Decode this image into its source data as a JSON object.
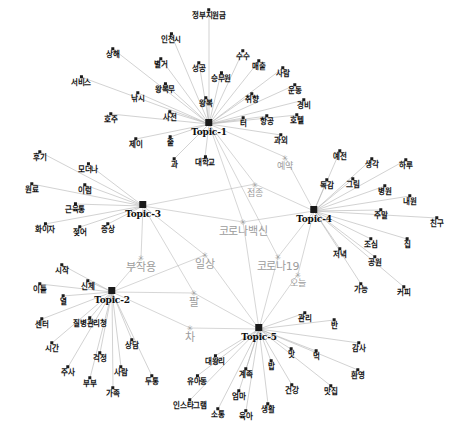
{
  "figure": {
    "type": "network-graph",
    "title": "",
    "background": "#ffffff",
    "node_color": "#111111",
    "shared_node_color": "#9c9c9c",
    "edge_color": "#b4b4b4",
    "width": 461,
    "height": 432
  },
  "chart_data": {
    "type": "network",
    "title": "",
    "topics": [
      {
        "id": "Topic-1",
        "label": "Topic-1",
        "x": 209,
        "y": 128
      },
      {
        "id": "Topic-2",
        "label": "Topic-2",
        "x": 112,
        "y": 296
      },
      {
        "id": "Topic-3",
        "label": "Topic-3",
        "x": 143,
        "y": 210
      },
      {
        "id": "Topic-4",
        "label": "Topic-4",
        "x": 314,
        "y": 215
      },
      {
        "id": "Topic-5",
        "label": "Topic-5",
        "x": 259,
        "y": 333
      }
    ],
    "keywords": [
      {
        "label": "정부지원금",
        "x": 209,
        "y": 14,
        "topic": "Topic-1"
      },
      {
        "label": "인천시",
        "x": 171,
        "y": 38,
        "topic": "Topic-1"
      },
      {
        "label": "수수",
        "x": 243,
        "y": 55,
        "topic": "Topic-1"
      },
      {
        "label": "상해",
        "x": 113,
        "y": 53,
        "topic": "Topic-1"
      },
      {
        "label": "별거",
        "x": 161,
        "y": 63,
        "topic": "Topic-1"
      },
      {
        "label": "성공",
        "x": 199,
        "y": 67,
        "topic": "Topic-1"
      },
      {
        "label": "승무원",
        "x": 221,
        "y": 77,
        "topic": "Topic-1"
      },
      {
        "label": "매출",
        "x": 259,
        "y": 65,
        "topic": "Topic-1"
      },
      {
        "label": "사람",
        "x": 283,
        "y": 72,
        "topic": "Topic-1"
      },
      {
        "label": "서비스",
        "x": 81,
        "y": 81,
        "topic": "Topic-1"
      },
      {
        "label": "왕복무",
        "x": 165,
        "y": 88,
        "topic": "Topic-1"
      },
      {
        "label": "낚시",
        "x": 138,
        "y": 97,
        "topic": "Topic-1"
      },
      {
        "label": "운동",
        "x": 295,
        "y": 89,
        "topic": "Topic-1"
      },
      {
        "label": "취향",
        "x": 252,
        "y": 98,
        "topic": "Topic-1"
      },
      {
        "label": "왕복",
        "x": 206,
        "y": 102,
        "topic": "Topic-1"
      },
      {
        "label": "경비",
        "x": 304,
        "y": 104,
        "topic": "Topic-1"
      },
      {
        "label": "호주",
        "x": 111,
        "y": 118,
        "topic": "Topic-1"
      },
      {
        "label": "사전",
        "x": 170,
        "y": 116,
        "topic": "Topic-1"
      },
      {
        "label": "터",
        "x": 243,
        "y": 122,
        "topic": "Topic-1"
      },
      {
        "label": "항공",
        "x": 267,
        "y": 120,
        "topic": "Topic-1"
      },
      {
        "label": "호텔",
        "x": 297,
        "y": 119,
        "topic": "Topic-1"
      },
      {
        "label": "제이",
        "x": 136,
        "y": 143,
        "topic": "Topic-1"
      },
      {
        "label": "줄",
        "x": 170,
        "y": 141,
        "topic": "Topic-1"
      },
      {
        "label": "과외",
        "x": 281,
        "y": 139,
        "topic": "Topic-1"
      },
      {
        "label": "과",
        "x": 174,
        "y": 163,
        "topic": "Topic-1"
      },
      {
        "label": "대학교",
        "x": 205,
        "y": 161,
        "topic": "Topic-1"
      },
      {
        "label": "후기",
        "x": 40,
        "y": 156,
        "topic": "Topic-3"
      },
      {
        "label": "모더나",
        "x": 88,
        "y": 168,
        "topic": "Topic-3"
      },
      {
        "label": "원료",
        "x": 32,
        "y": 188,
        "topic": "Topic-3"
      },
      {
        "label": "이럼",
        "x": 85,
        "y": 189,
        "topic": "Topic-3"
      },
      {
        "label": "근육통",
        "x": 75,
        "y": 208,
        "topic": "Topic-3"
      },
      {
        "label": "화이자",
        "x": 45,
        "y": 228,
        "topic": "Topic-3"
      },
      {
        "label": "젖어",
        "x": 80,
        "y": 231,
        "topic": "Topic-3"
      },
      {
        "label": "증상",
        "x": 108,
        "y": 228,
        "topic": "Topic-3"
      },
      {
        "label": "예전",
        "x": 340,
        "y": 155,
        "topic": "Topic-4"
      },
      {
        "label": "생각",
        "x": 372,
        "y": 163,
        "topic": "Topic-4"
      },
      {
        "label": "하루",
        "x": 406,
        "y": 164,
        "topic": "Topic-4"
      },
      {
        "label": "독감",
        "x": 327,
        "y": 184,
        "topic": "Topic-4"
      },
      {
        "label": "그림",
        "x": 353,
        "y": 183,
        "topic": "Topic-4"
      },
      {
        "label": "병원",
        "x": 385,
        "y": 190,
        "topic": "Topic-4"
      },
      {
        "label": "내원",
        "x": 410,
        "y": 200,
        "topic": "Topic-4"
      },
      {
        "label": "주말",
        "x": 381,
        "y": 214,
        "topic": "Topic-4"
      },
      {
        "label": "친구",
        "x": 437,
        "y": 222,
        "topic": "Topic-4"
      },
      {
        "label": "조심",
        "x": 371,
        "y": 243,
        "topic": "Topic-4"
      },
      {
        "label": "집",
        "x": 407,
        "y": 243,
        "topic": "Topic-4"
      },
      {
        "label": "저녁",
        "x": 340,
        "y": 253,
        "topic": "Topic-4"
      },
      {
        "label": "공원",
        "x": 375,
        "y": 261,
        "topic": "Topic-4"
      },
      {
        "label": "가능",
        "x": 361,
        "y": 288,
        "topic": "Topic-4"
      },
      {
        "label": "커피",
        "x": 404,
        "y": 291,
        "topic": "Topic-4"
      },
      {
        "label": "시작",
        "x": 62,
        "y": 269,
        "topic": "Topic-2"
      },
      {
        "label": "이틀",
        "x": 40,
        "y": 288,
        "topic": "Topic-2"
      },
      {
        "label": "신체",
        "x": 88,
        "y": 285,
        "topic": "Topic-2"
      },
      {
        "label": "열",
        "x": 63,
        "y": 300,
        "topic": "Topic-2"
      },
      {
        "label": "센터",
        "x": 42,
        "y": 323,
        "topic": "Topic-2"
      },
      {
        "label": "질병관리청",
        "x": 90,
        "y": 322,
        "topic": "Topic-2"
      },
      {
        "label": "상담",
        "x": 132,
        "y": 344,
        "topic": "Topic-2"
      },
      {
        "label": "시간",
        "x": 52,
        "y": 347,
        "topic": "Topic-2"
      },
      {
        "label": "걱정",
        "x": 100,
        "y": 357,
        "topic": "Topic-2"
      },
      {
        "label": "주사",
        "x": 68,
        "y": 371,
        "topic": "Topic-2"
      },
      {
        "label": "사람",
        "x": 121,
        "y": 371,
        "topic": "Topic-2"
      },
      {
        "label": "부부",
        "x": 90,
        "y": 382,
        "topic": "Topic-2"
      },
      {
        "label": "가족",
        "x": 113,
        "y": 392,
        "topic": "Topic-2"
      },
      {
        "label": "두통",
        "x": 152,
        "y": 380,
        "topic": "Topic-2"
      },
      {
        "label": "관리",
        "x": 305,
        "y": 317,
        "topic": "Topic-5"
      },
      {
        "label": "반",
        "x": 334,
        "y": 324,
        "topic": "Topic-5"
      },
      {
        "label": "먹",
        "x": 316,
        "y": 355,
        "topic": "Topic-5"
      },
      {
        "label": "감사",
        "x": 359,
        "y": 347,
        "topic": "Topic-5"
      },
      {
        "label": "맛",
        "x": 291,
        "y": 353,
        "topic": "Topic-5"
      },
      {
        "label": "환영",
        "x": 358,
        "y": 374,
        "topic": "Topic-5"
      },
      {
        "label": "대왕리",
        "x": 215,
        "y": 360,
        "topic": "Topic-5"
      },
      {
        "label": "밥",
        "x": 271,
        "y": 365,
        "topic": "Topic-5"
      },
      {
        "label": "유아동",
        "x": 197,
        "y": 380,
        "topic": "Topic-5"
      },
      {
        "label": "계족",
        "x": 246,
        "y": 373,
        "topic": "Topic-5"
      },
      {
        "label": "건강",
        "x": 292,
        "y": 389,
        "topic": "Topic-5"
      },
      {
        "label": "맛집",
        "x": 331,
        "y": 390,
        "topic": "Topic-5"
      },
      {
        "label": "인스타그램",
        "x": 190,
        "y": 404,
        "topic": "Topic-5"
      },
      {
        "label": "엄마",
        "x": 239,
        "y": 395,
        "topic": "Topic-5"
      },
      {
        "label": "소통",
        "x": 218,
        "y": 413,
        "topic": "Topic-5"
      },
      {
        "label": "육아",
        "x": 246,
        "y": 415,
        "topic": "Topic-5"
      },
      {
        "label": "생활",
        "x": 268,
        "y": 408,
        "topic": "Topic-5"
      }
    ],
    "shared_nodes": [
      {
        "label": "예약",
        "x": 285,
        "y": 163,
        "size": "normal"
      },
      {
        "label": "접종",
        "x": 255,
        "y": 190,
        "size": "normal"
      },
      {
        "label": "코로나백신",
        "x": 243,
        "y": 228,
        "size": "big"
      },
      {
        "label": "부작용",
        "x": 141,
        "y": 264,
        "size": "big"
      },
      {
        "label": "일상",
        "x": 205,
        "y": 261,
        "size": "big"
      },
      {
        "label": "코로나19",
        "x": 278,
        "y": 263,
        "size": "big"
      },
      {
        "label": "오늘",
        "x": 298,
        "y": 280,
        "size": "normal"
      },
      {
        "label": "팔",
        "x": 194,
        "y": 299,
        "size": "big"
      },
      {
        "label": "차",
        "x": 190,
        "y": 334,
        "size": "big"
      }
    ],
    "edges_note": "Each keyword connects to its listed topic hub; shared gray nodes connect to two or more topic hubs."
  }
}
